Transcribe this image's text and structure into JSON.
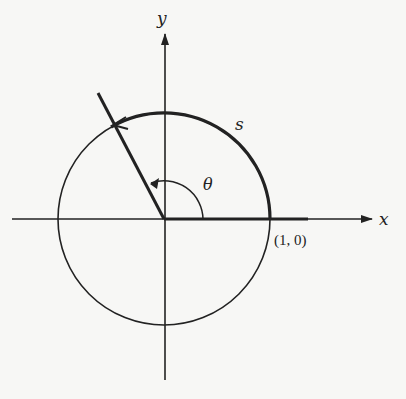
{
  "diagram": {
    "type": "unit-circle-arc-length",
    "labels": {
      "x_axis": "x",
      "y_axis": "y",
      "arc": "s",
      "angle": "θ",
      "point": "(1, 0)"
    },
    "colors": {
      "background": "#f7f7f5",
      "ink": "#222222"
    }
  }
}
